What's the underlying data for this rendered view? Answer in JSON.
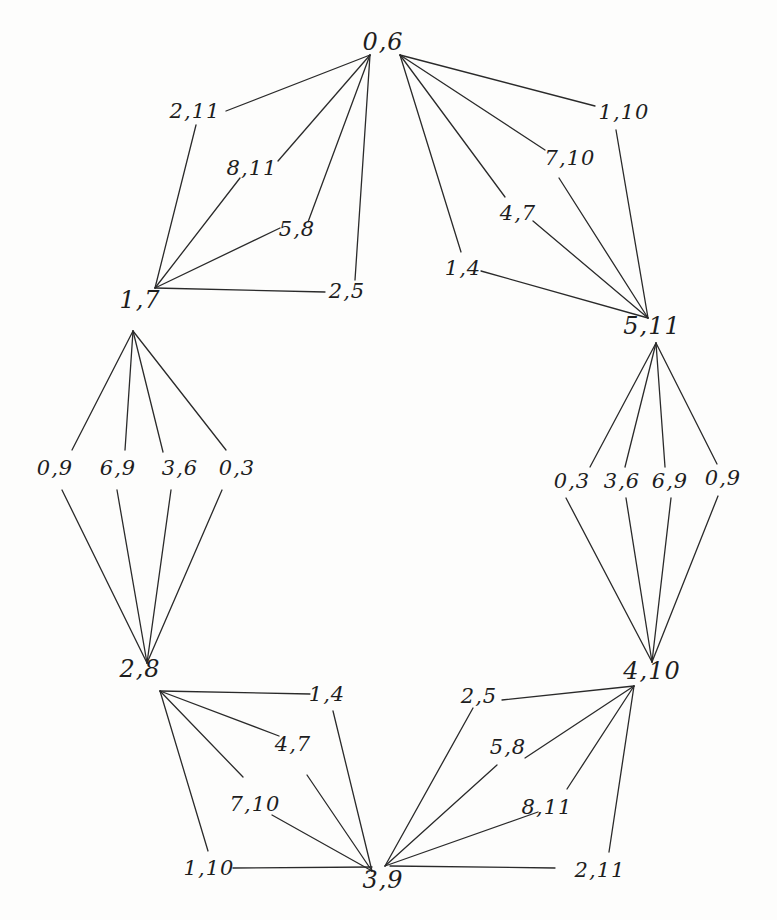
{
  "diagram": {
    "type": "graph",
    "hubs": [
      {
        "id": "h06",
        "label": "0,6",
        "x": 383,
        "y": 42
      },
      {
        "id": "h511",
        "label": "5,11",
        "x": 652,
        "y": 326
      },
      {
        "id": "h410",
        "label": "4,10",
        "x": 652,
        "y": 671
      },
      {
        "id": "h39",
        "label": "3,9",
        "x": 383,
        "y": 880
      },
      {
        "id": "h28",
        "label": "2,8",
        "x": 140,
        "y": 669
      },
      {
        "id": "h17",
        "label": "1,7",
        "x": 140,
        "y": 300
      }
    ],
    "leaves": [
      {
        "id": "a1",
        "label": "2,11",
        "x": 195,
        "y": 111
      },
      {
        "id": "a2",
        "label": "8,11",
        "x": 252,
        "y": 168
      },
      {
        "id": "a3",
        "label": "5,8",
        "x": 297,
        "y": 229
      },
      {
        "id": "a4",
        "label": "2,5",
        "x": 347,
        "y": 291
      },
      {
        "id": "b1",
        "label": "1,10",
        "x": 624,
        "y": 112
      },
      {
        "id": "b2",
        "label": "7,10",
        "x": 570,
        "y": 158
      },
      {
        "id": "b3",
        "label": "4,7",
        "x": 518,
        "y": 213
      },
      {
        "id": "b4",
        "label": "1,4",
        "x": 463,
        "y": 268
      },
      {
        "id": "c1",
        "label": "0,9",
        "x": 55,
        "y": 468
      },
      {
        "id": "c2",
        "label": "6,9",
        "x": 118,
        "y": 468
      },
      {
        "id": "c3",
        "label": "3,6",
        "x": 180,
        "y": 468
      },
      {
        "id": "c4",
        "label": "0,3",
        "x": 237,
        "y": 468
      },
      {
        "id": "d1",
        "label": "0,3",
        "x": 572,
        "y": 481
      },
      {
        "id": "d2",
        "label": "3,6",
        "x": 622,
        "y": 481
      },
      {
        "id": "d3",
        "label": "6,9",
        "x": 670,
        "y": 481
      },
      {
        "id": "d4",
        "label": "0,9",
        "x": 723,
        "y": 478
      },
      {
        "id": "e1",
        "label": "1,4",
        "x": 327,
        "y": 694
      },
      {
        "id": "e2",
        "label": "4,7",
        "x": 293,
        "y": 744
      },
      {
        "id": "e3",
        "label": "7,10",
        "x": 255,
        "y": 804
      },
      {
        "id": "e4",
        "label": "1,10",
        "x": 209,
        "y": 868
      },
      {
        "id": "f1",
        "label": "2,5",
        "x": 479,
        "y": 696
      },
      {
        "id": "f2",
        "label": "5,8",
        "x": 508,
        "y": 747
      },
      {
        "id": "f3",
        "label": "8,11",
        "x": 547,
        "y": 807
      },
      {
        "id": "f4",
        "label": "2,11",
        "x": 600,
        "y": 870
      }
    ],
    "edges": [
      [
        226,
        111,
        370,
        55
      ],
      [
        278,
        161,
        370,
        55
      ],
      [
        308,
        222,
        370,
        55
      ],
      [
        355,
        280,
        370,
        55
      ],
      [
        196,
        125,
        155,
        288
      ],
      [
        240,
        178,
        155,
        288
      ],
      [
        280,
        228,
        155,
        288
      ],
      [
        325,
        292,
        155,
        288
      ],
      [
        400,
        55,
        595,
        106
      ],
      [
        400,
        55,
        545,
        150
      ],
      [
        400,
        55,
        505,
        197
      ],
      [
        400,
        55,
        461,
        252
      ],
      [
        616,
        130,
        648,
        318
      ],
      [
        559,
        178,
        648,
        318
      ],
      [
        533,
        221,
        648,
        318
      ],
      [
        481,
        271,
        648,
        318
      ],
      [
        133,
        331,
        72,
        450
      ],
      [
        133,
        331,
        125,
        450
      ],
      [
        133,
        331,
        163,
        452
      ],
      [
        133,
        331,
        226,
        450
      ],
      [
        62,
        490,
        147,
        663
      ],
      [
        117,
        490,
        147,
        663
      ],
      [
        171,
        490,
        147,
        663
      ],
      [
        222,
        490,
        147,
        663
      ],
      [
        656,
        343,
        590,
        467
      ],
      [
        656,
        343,
        625,
        467
      ],
      [
        656,
        343,
        665,
        467
      ],
      [
        656,
        343,
        717,
        464
      ],
      [
        566,
        498,
        652,
        662
      ],
      [
        626,
        498,
        652,
        662
      ],
      [
        671,
        498,
        652,
        662
      ],
      [
        718,
        496,
        652,
        662
      ],
      [
        160,
        691,
        310,
        694
      ],
      [
        160,
        691,
        279,
        736
      ],
      [
        160,
        691,
        243,
        777
      ],
      [
        160,
        691,
        208,
        851
      ],
      [
        333,
        711,
        372,
        871
      ],
      [
        307,
        775,
        372,
        871
      ],
      [
        272,
        815,
        372,
        871
      ],
      [
        233,
        868,
        372,
        867
      ],
      [
        502,
        700,
        634,
        686
      ],
      [
        525,
        758,
        634,
        686
      ],
      [
        567,
        789,
        634,
        686
      ],
      [
        609,
        852,
        634,
        686
      ],
      [
        473,
        708,
        385,
        866
      ],
      [
        497,
        765,
        385,
        866
      ],
      [
        538,
        812,
        385,
        866
      ],
      [
        555,
        868,
        390,
        866
      ]
    ]
  }
}
